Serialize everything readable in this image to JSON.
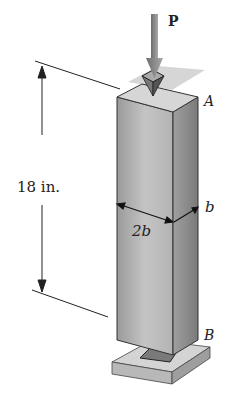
{
  "figure": {
    "load_label": "P",
    "point_top": "A",
    "point_bottom": "B",
    "height_dim": "18 in.",
    "width_dim": "2b",
    "depth_dim": "b"
  },
  "colors": {
    "front_face": "#bdbdbd",
    "side_face": "#8f8f8f",
    "top_face": "#d8d8d8",
    "plate": "#cfcfcf",
    "arrow": "#8a8a8a",
    "line": "#222222"
  }
}
